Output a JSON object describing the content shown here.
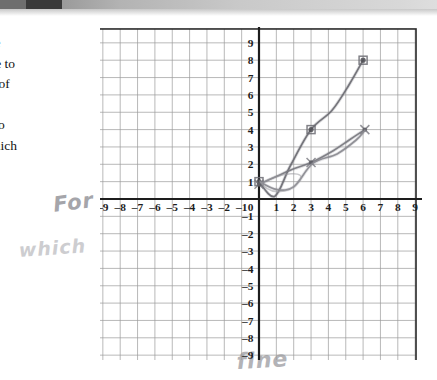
{
  "page": {
    "body_text": "the\nure to\nes of\ne\nd to\nwhich",
    "handwriting": [
      {
        "id": "for",
        "text": "For"
      },
      {
        "id": "which",
        "text": "which"
      },
      {
        "id": "fine",
        "text": "fine"
      }
    ]
  },
  "chart_data": {
    "type": "line",
    "title": "",
    "xlabel": "x",
    "ylabel": "y",
    "xlim": [
      -10,
      10
    ],
    "ylim": [
      -10,
      10
    ],
    "grid": true,
    "legend": "none",
    "x_tick_labels": [
      "-9",
      "-8",
      "-7",
      "-6",
      "-5",
      "-4",
      "-3",
      "-2",
      "-1",
      "0",
      "1",
      "2",
      "3",
      "4",
      "5",
      "6",
      "7",
      "8",
      "9"
    ],
    "y_tick_labels": [
      "9",
      "8",
      "7",
      "6",
      "5",
      "4",
      "3",
      "2",
      "1",
      "0",
      "-1",
      "-2",
      "-3",
      "-4",
      "-5",
      "-6",
      "-7",
      "-8",
      "-9"
    ],
    "axis_origin_label": "0",
    "series": [
      {
        "name": "curve-steep",
        "color": "#6b6b72",
        "marker": "square",
        "points": [
          {
            "x": 0.0,
            "y": 1.0
          },
          {
            "x": 0.9,
            "y": 0.15
          },
          {
            "x": 1.8,
            "y": 1.9
          },
          {
            "x": 3.0,
            "y": 4.0
          },
          {
            "x": 4.2,
            "y": 5.1
          },
          {
            "x": 5.2,
            "y": 6.6
          },
          {
            "x": 6.0,
            "y": 8.0
          }
        ],
        "marked_points": [
          {
            "x": 0.0,
            "y": 1.0
          },
          {
            "x": 3.0,
            "y": 4.0
          },
          {
            "x": 6.0,
            "y": 8.0
          }
        ]
      },
      {
        "name": "curve-shallow",
        "color": "#78787f",
        "marker": "cross",
        "points": [
          {
            "x": 0.0,
            "y": 0.85
          },
          {
            "x": 0.9,
            "y": 1.25
          },
          {
            "x": 1.9,
            "y": 1.7
          },
          {
            "x": 3.0,
            "y": 2.1
          },
          {
            "x": 4.3,
            "y": 2.8
          },
          {
            "x": 5.2,
            "y": 3.4
          },
          {
            "x": 6.1,
            "y": 4.0
          }
        ],
        "marked_points": [
          {
            "x": 0.0,
            "y": 0.85
          },
          {
            "x": 3.0,
            "y": 2.1
          },
          {
            "x": 6.1,
            "y": 4.0
          }
        ]
      },
      {
        "name": "curve-loop-tail",
        "color": "#8a8a90",
        "marker": "none",
        "points": [
          {
            "x": 0.1,
            "y": 0.95
          },
          {
            "x": 1.0,
            "y": 0.55
          },
          {
            "x": 2.0,
            "y": 0.7
          },
          {
            "x": 3.1,
            "y": 2.05
          },
          {
            "x": 4.5,
            "y": 2.6
          },
          {
            "x": 5.6,
            "y": 3.4
          },
          {
            "x": 6.1,
            "y": 3.95
          }
        ],
        "marked_points": []
      }
    ]
  }
}
